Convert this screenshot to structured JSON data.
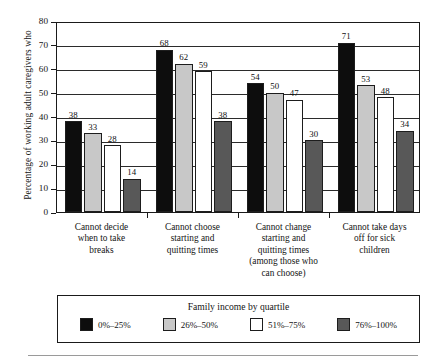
{
  "chart_data": {
    "type": "bar",
    "title": "",
    "xlabel": "",
    "ylabel": "Percentage of working adult caregivers who",
    "ylim": [
      0,
      80
    ],
    "yticks": [
      0,
      10,
      20,
      30,
      40,
      50,
      60,
      70,
      80
    ],
    "ytick_labels": [
      "0",
      "10",
      "20",
      "30",
      "40",
      "50",
      "60",
      "70",
      "80"
    ],
    "grid": true,
    "legend_position": "bottom",
    "legend_title": "Family income by quartile",
    "categories": [
      "Cannot decide\nwhen to take\nbreaks",
      "Cannot choose\nstarting and\nquitting times",
      "Cannot change\nstarting and\nquitting times\n(among those who\ncan choose)",
      "Cannot take days\noff for sick\nchildren"
    ],
    "category_lines": [
      [
        "Cannot decide",
        "when to take",
        "breaks"
      ],
      [
        "Cannot choose",
        "starting and",
        "quitting times"
      ],
      [
        "Cannot change",
        "starting and",
        "quitting times",
        "(among those who",
        "can choose)"
      ],
      [
        "Cannot take days",
        "off for sick",
        "children"
      ]
    ],
    "series": [
      {
        "name": "0%–25%",
        "color": "#0d0d0d",
        "values": [
          38,
          68,
          54,
          71
        ]
      },
      {
        "name": "26%–50%",
        "color": "#c8c8c8",
        "values": [
          33,
          62,
          50,
          53
        ]
      },
      {
        "name": "51%–75%",
        "color": "#ffffff",
        "values": [
          28,
          59,
          47,
          48
        ]
      },
      {
        "name": "76%–100%",
        "color": "#585858",
        "values": [
          14,
          38,
          30,
          34
        ]
      }
    ]
  }
}
